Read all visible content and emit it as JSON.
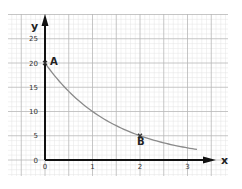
{
  "chart_data": {
    "type": "line",
    "title": "",
    "xlabel": "x",
    "ylabel": "y",
    "xlim": [
      0,
      3.2
    ],
    "ylim": [
      0,
      28
    ],
    "x_ticks": [
      "0",
      "1",
      "2",
      "3"
    ],
    "y_ticks": [
      "0",
      "5",
      "10",
      "15",
      "20",
      "25"
    ],
    "grid": true,
    "legend": null,
    "series": [
      {
        "name": "curve",
        "x": [
          0,
          0.25,
          0.5,
          0.75,
          1,
          1.25,
          1.5,
          1.75,
          2,
          2.25,
          2.5,
          2.75,
          3,
          3.2
        ],
        "y": [
          20,
          16.8,
          14.1,
          11.9,
          10,
          8.4,
          7.1,
          5.9,
          5,
          4.2,
          3.5,
          3.0,
          2.5,
          2.2
        ]
      }
    ],
    "annotations": [
      {
        "label": "A",
        "x": 0,
        "y": 20
      },
      {
        "label": "B",
        "x": 2,
        "y": 5
      }
    ]
  },
  "axes": {
    "x_name": "x",
    "y_name": "y"
  },
  "points": {
    "a_label": "A",
    "b_label": "B"
  },
  "colors": {
    "curve": "#8a8a8a",
    "axis": "#111111",
    "grid_major": "#b8b8b8",
    "grid_minor": "#e4e4e4"
  }
}
